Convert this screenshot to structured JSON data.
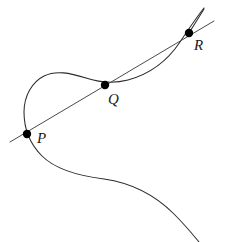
{
  "figure": {
    "background_color": "#ffffff",
    "width": 225,
    "height": 242,
    "curve_color": "#2b2b2b",
    "line_color": "#4a4a4a",
    "dot_color": "#000000",
    "label_color": "#1a1a1a"
  },
  "points": [
    {
      "id": "P",
      "label": "P",
      "x": 27,
      "y": 134,
      "label_x": 37,
      "label_y": 143,
      "radius": 4.2
    },
    {
      "id": "Q",
      "label": "Q",
      "x": 105,
      "y": 85,
      "label_x": 108,
      "label_y": 104,
      "radius": 4.2
    },
    {
      "id": "R",
      "label": "R",
      "x": 189,
      "y": 33,
      "label_x": 194,
      "label_y": 50,
      "radius": 4.2
    }
  ],
  "paths": {
    "curve": "M 204,8 C 196,18 188,30 180,42 C 168,60 150,74 128,80 C 112,84 98,82 86,78 C 70,73 56,70 44,76 C 32,82 24,96 24,112 C 24,128 30,144 42,156 C 56,170 80,176 104,179 C 132,183 156,196 174,214 C 186,226 194,236 199,242",
    "secant": "M 10,142 L 214,21",
    "tangent_branch": "M 189,33 L 204,9"
  },
  "secant": {
    "name": "secant-line",
    "start_x": 10,
    "start_y": 142,
    "end_x": 214,
    "end_y": 21
  },
  "chart_data": {
    "type": "scatter",
    "xlabel": "",
    "ylabel": "",
    "categories": [
      "P",
      "Q",
      "R"
    ],
    "x": [
      27,
      105,
      189
    ],
    "y": [
      134,
      85,
      33
    ],
    "series": [
      {
        "name": "collinear-points",
        "values": [
          134,
          85,
          33
        ]
      }
    ],
    "annotations": [
      "P",
      "Q",
      "R"
    ],
    "grid": false,
    "legend": "none"
  }
}
